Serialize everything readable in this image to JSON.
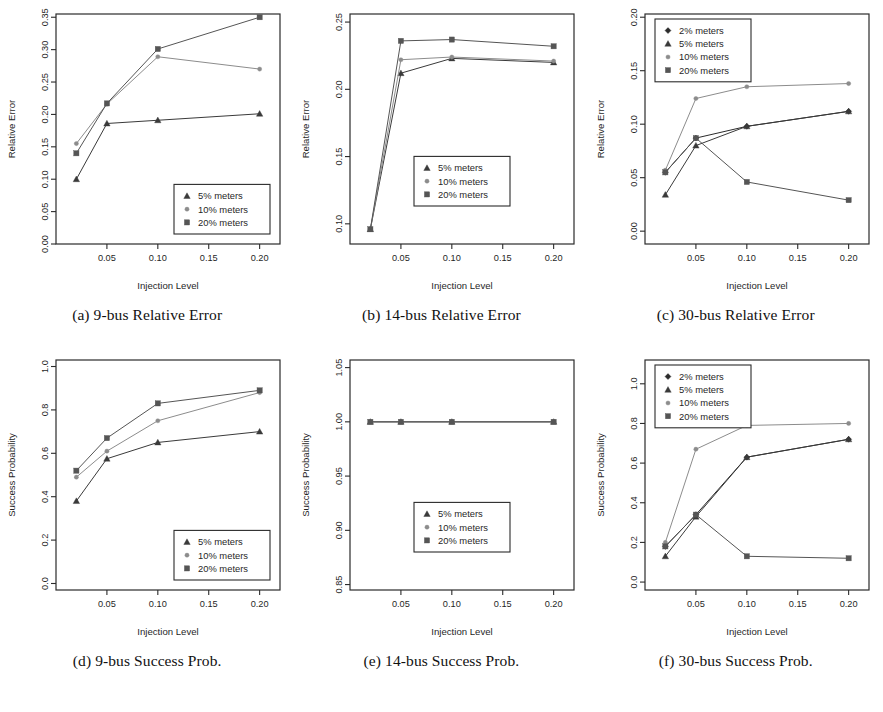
{
  "figure": {
    "panel_width": 294,
    "panel_height": 300,
    "series_styles": {
      "2% meters": {
        "marker": "diamond",
        "color": "#2b2b2b"
      },
      "5% meters": {
        "marker": "triangle",
        "color": "#3a3a3a"
      },
      "10% meters": {
        "marker": "circle",
        "color": "#8c8c8c"
      },
      "20% meters": {
        "marker": "square",
        "color": "#555555"
      }
    }
  },
  "chart_data": [
    {
      "id": "a",
      "type": "line",
      "caption": "(a) 9-bus Relative Error",
      "title": "",
      "xlabel": "Injection Level",
      "ylabel": "Relative Error",
      "x": [
        0.02,
        0.05,
        0.1,
        0.2
      ],
      "xlim": [
        0.0,
        0.22
      ],
      "ylim": [
        0.0,
        0.355
      ],
      "xticks": [
        0.05,
        0.1,
        0.15,
        0.2
      ],
      "xticklabels": [
        "0.05",
        "0.10",
        "0.15",
        "0.20"
      ],
      "yticks": [
        0.0,
        0.05,
        0.1,
        0.15,
        0.2,
        0.25,
        0.3,
        0.35
      ],
      "yticklabels": [
        "0.00",
        "0.05",
        "0.10",
        "0.15",
        "0.20",
        "0.25",
        "0.30",
        "0.35"
      ],
      "grid": false,
      "legend_position": "bottom-right",
      "legend": [
        "5% meters",
        "10% meters",
        "20% meters"
      ],
      "series": [
        {
          "name": "5% meters",
          "values": [
            0.1,
            0.186,
            0.191,
            0.201
          ]
        },
        {
          "name": "10% meters",
          "values": [
            0.155,
            0.216,
            0.289,
            0.27
          ]
        },
        {
          "name": "20% meters",
          "values": [
            0.14,
            0.217,
            0.301,
            0.35
          ]
        }
      ]
    },
    {
      "id": "b",
      "type": "line",
      "caption": "(b) 14-bus Relative Error",
      "title": "",
      "xlabel": "Injection Level",
      "ylabel": "Relative Error",
      "x": [
        0.02,
        0.05,
        0.1,
        0.2
      ],
      "xlim": [
        0.0,
        0.22
      ],
      "ylim": [
        0.085,
        0.256
      ],
      "xticks": [
        0.05,
        0.1,
        0.15,
        0.2
      ],
      "xticklabels": [
        "0.05",
        "0.10",
        "0.15",
        "0.20"
      ],
      "yticks": [
        0.1,
        0.15,
        0.2,
        0.25
      ],
      "yticklabels": [
        "0.10",
        "0.15",
        "0.20",
        "0.25"
      ],
      "grid": false,
      "legend_position": "bottom-center",
      "legend": [
        "5% meters",
        "10% meters",
        "20% meters"
      ],
      "series": [
        {
          "name": "5% meters",
          "values": [
            0.096,
            0.212,
            0.223,
            0.22
          ]
        },
        {
          "name": "10% meters",
          "values": [
            0.096,
            0.222,
            0.224,
            0.221
          ]
        },
        {
          "name": "20% meters",
          "values": [
            0.096,
            0.236,
            0.237,
            0.232
          ]
        }
      ]
    },
    {
      "id": "c",
      "type": "line",
      "caption": "(c) 30-bus Relative Error",
      "title": "",
      "xlabel": "Injection Level",
      "ylabel": "Relative Error",
      "x": [
        0.02,
        0.05,
        0.1,
        0.2
      ],
      "xlim": [
        0.0,
        0.22
      ],
      "ylim": [
        -0.012,
        0.203
      ],
      "xticks": [
        0.05,
        0.1,
        0.15,
        0.2
      ],
      "xticklabels": [
        "0.05",
        "0.10",
        "0.15",
        "0.20"
      ],
      "yticks": [
        0.0,
        0.05,
        0.1,
        0.15,
        0.2
      ],
      "yticklabels": [
        "0.00",
        "0.05",
        "0.10",
        "0.15",
        "0.20"
      ],
      "grid": false,
      "legend_position": "top-left",
      "legend": [
        "2% meters",
        "5% meters",
        "10% meters",
        "20% meters"
      ],
      "series": [
        {
          "name": "2% meters",
          "values": [
            0.055,
            0.087,
            0.098,
            0.112
          ]
        },
        {
          "name": "5% meters",
          "values": [
            0.034,
            0.08,
            0.098,
            0.112
          ]
        },
        {
          "name": "10% meters",
          "values": [
            0.057,
            0.124,
            0.135,
            0.138
          ]
        },
        {
          "name": "20% meters",
          "values": [
            0.055,
            0.087,
            0.046,
            0.029
          ]
        }
      ]
    },
    {
      "id": "d",
      "type": "line",
      "caption": "(d) 9-bus Success Prob.",
      "title": "",
      "xlabel": "Injection Level",
      "ylabel": "Success Probability",
      "x": [
        0.02,
        0.05,
        0.1,
        0.2
      ],
      "xlim": [
        0.0,
        0.22
      ],
      "ylim": [
        -0.03,
        1.03
      ],
      "xticks": [
        0.05,
        0.1,
        0.15,
        0.2
      ],
      "xticklabels": [
        "0.05",
        "0.10",
        "0.15",
        "0.20"
      ],
      "yticks": [
        0.0,
        0.2,
        0.4,
        0.6,
        0.8,
        1.0
      ],
      "yticklabels": [
        "0.0",
        "0.2",
        "0.4",
        "0.6",
        "0.8",
        "1.0"
      ],
      "grid": false,
      "legend_position": "bottom-right",
      "legend": [
        "5% meters",
        "10% meters",
        "20% meters"
      ],
      "series": [
        {
          "name": "5% meters",
          "values": [
            0.38,
            0.575,
            0.65,
            0.7
          ]
        },
        {
          "name": "10% meters",
          "values": [
            0.49,
            0.61,
            0.75,
            0.88
          ]
        },
        {
          "name": "20% meters",
          "values": [
            0.52,
            0.67,
            0.83,
            0.89
          ]
        }
      ]
    },
    {
      "id": "e",
      "type": "line",
      "caption": "(e) 14-bus Success Prob.",
      "title": "",
      "xlabel": "Injection Level",
      "ylabel": "Success Probability",
      "x": [
        0.02,
        0.05,
        0.1,
        0.2
      ],
      "xlim": [
        0.0,
        0.22
      ],
      "ylim": [
        0.845,
        1.057
      ],
      "xticks": [
        0.05,
        0.1,
        0.15,
        0.2
      ],
      "xticklabels": [
        "0.05",
        "0.10",
        "0.15",
        "0.20"
      ],
      "yticks": [
        0.85,
        0.9,
        0.95,
        1.0,
        1.05
      ],
      "yticklabels": [
        "0.85",
        "0.90",
        "0.95",
        "1.00",
        "1.05"
      ],
      "grid": false,
      "legend_position": "bottom-center",
      "legend": [
        "5% meters",
        "10% meters",
        "20% meters"
      ],
      "series": [
        {
          "name": "5% meters",
          "values": [
            1.0,
            1.0,
            1.0,
            1.0
          ]
        },
        {
          "name": "10% meters",
          "values": [
            1.0,
            1.0,
            1.0,
            1.0
          ]
        },
        {
          "name": "20% meters",
          "values": [
            1.0,
            1.0,
            1.0,
            1.0
          ]
        }
      ]
    },
    {
      "id": "f",
      "type": "line",
      "caption": "(f) 30-bus Success Prob.",
      "title": "",
      "xlabel": "Injection Level",
      "ylabel": "Success Probability",
      "x": [
        0.02,
        0.05,
        0.1,
        0.2
      ],
      "xlim": [
        0.0,
        0.22
      ],
      "ylim": [
        -0.04,
        1.12
      ],
      "xticks": [
        0.05,
        0.1,
        0.15,
        0.2
      ],
      "xticklabels": [
        "0.05",
        "0.10",
        "0.15",
        "0.20"
      ],
      "yticks": [
        0.0,
        0.2,
        0.4,
        0.6,
        0.8,
        1.0
      ],
      "yticklabels": [
        "0.0",
        "0.2",
        "0.4",
        "0.6",
        "0.8",
        "1.0"
      ],
      "grid": false,
      "legend_position": "top-left",
      "legend": [
        "2% meters",
        "5% meters",
        "10% meters",
        "20% meters"
      ],
      "series": [
        {
          "name": "2% meters",
          "values": [
            0.18,
            0.34,
            0.63,
            0.72
          ]
        },
        {
          "name": "5% meters",
          "values": [
            0.13,
            0.33,
            0.63,
            0.72
          ]
        },
        {
          "name": "10% meters",
          "values": [
            0.2,
            0.67,
            0.79,
            0.8
          ]
        },
        {
          "name": "20% meters",
          "values": [
            0.18,
            0.34,
            0.13,
            0.12
          ]
        }
      ]
    }
  ]
}
